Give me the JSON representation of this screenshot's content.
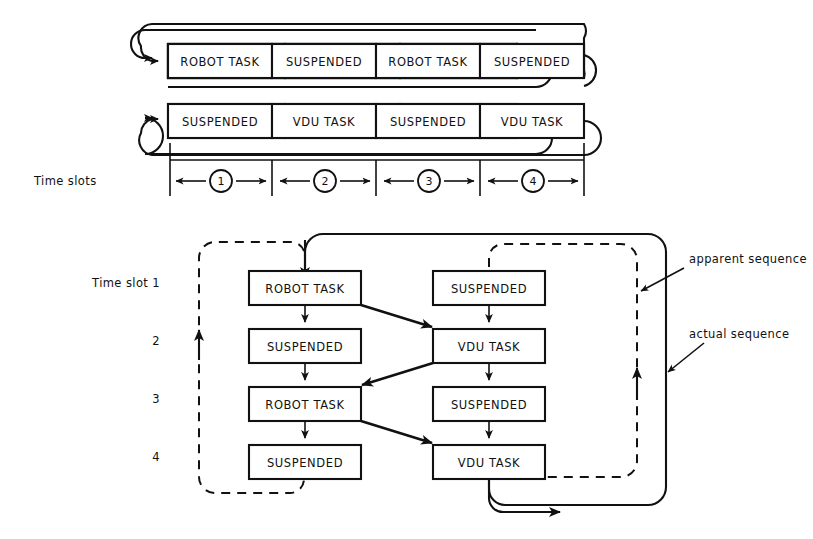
{
  "figure": {
    "labels": {
      "time_slots": "Time slots",
      "time_slot_first": "Time slot 1",
      "apparent_sequence": "apparent sequence",
      "actual_sequence": "actual sequence"
    },
    "colors": {
      "ink": "#111111",
      "paper": "#ffffff"
    },
    "timeline": {
      "slot_numbers": [
        "1",
        "2",
        "3",
        "4"
      ],
      "rows": [
        {
          "name": "robot-task-timeline",
          "cells": [
            "ROBOT TASK",
            "SUSPENDED",
            "ROBOT TASK",
            "SUSPENDED"
          ]
        },
        {
          "name": "vdu-task-timeline",
          "cells": [
            "SUSPENDED",
            "VDU TASK",
            "SUSPENDED",
            "VDU TASK"
          ]
        }
      ]
    },
    "sequence": {
      "row_labels": [
        "Time slot 1",
        "2",
        "3",
        "4"
      ],
      "left_column": [
        "ROBOT TASK",
        "SUSPENDED",
        "ROBOT TASK",
        "SUSPENDED"
      ],
      "right_column": [
        "SUSPENDED",
        "VDU TASK",
        "SUSPENDED",
        "VDU TASK"
      ]
    }
  }
}
